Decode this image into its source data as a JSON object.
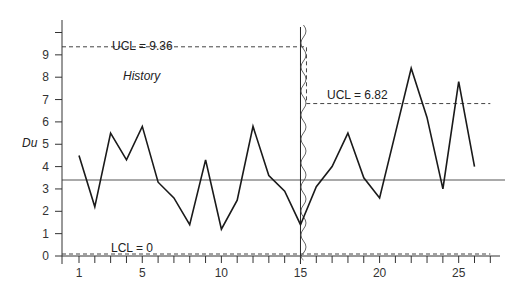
{
  "chart_data": {
    "type": "line",
    "title": "",
    "xlabel": "",
    "ylabel": "Du",
    "x": [
      1,
      2,
      3,
      4,
      5,
      6,
      7,
      8,
      9,
      10,
      11,
      12,
      13,
      14,
      15,
      16,
      17,
      18,
      19,
      20,
      21,
      22,
      23,
      24,
      25,
      26
    ],
    "series": [
      {
        "name": "Du",
        "values": [
          4.5,
          2.2,
          5.5,
          4.3,
          5.8,
          3.3,
          2.6,
          1.4,
          4.3,
          1.2,
          2.5,
          5.8,
          3.6,
          2.9,
          1.4,
          3.1,
          4.0,
          5.5,
          3.5,
          2.6,
          5.5,
          8.4,
          6.2,
          3.0,
          7.8,
          4.0
        ]
      }
    ],
    "center_line": 3.4,
    "control_limits": [
      {
        "label": "UCL = 9.36",
        "value": 9.36,
        "x_start": 0,
        "x_end": 15.4
      },
      {
        "label": "UCL = 6.82",
        "value": 6.82,
        "x_start": 15.4,
        "x_end": 27
      },
      {
        "label": "LCL = 0",
        "value": 0,
        "x_start": 0,
        "x_end": 27
      }
    ],
    "annotations": [
      {
        "text": "History",
        "x": 4,
        "y": 8
      }
    ],
    "phase_split_x": 15,
    "x_ticks": [
      1,
      5,
      10,
      15,
      20,
      25
    ],
    "x_tick_labels": [
      "1",
      "5",
      "10",
      "15",
      "20",
      "25"
    ],
    "y_ticks": [
      0,
      1,
      2,
      3,
      4,
      5,
      6,
      7,
      8,
      9,
      10
    ],
    "y_tick_labels": [
      "0",
      "1",
      "2",
      "3",
      "4",
      "5",
      "6",
      "7",
      "8",
      "9",
      ""
    ],
    "xlim": [
      -0.1,
      27.7
    ],
    "ylim": [
      0,
      10.5
    ],
    "grid": false,
    "legend": "none"
  },
  "labels": {
    "ylabel": "Du",
    "history": "History",
    "ucl_history": "UCL = 9.36",
    "ucl_current": "UCL = 6.82",
    "lcl": "LCL = 0"
  }
}
